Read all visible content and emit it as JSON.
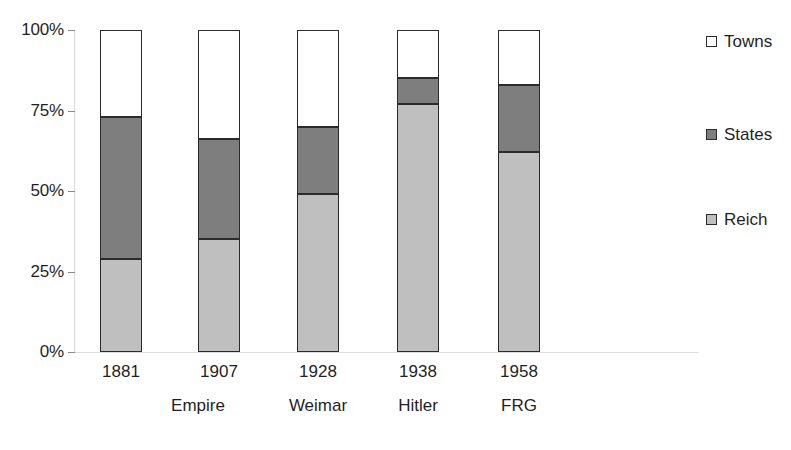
{
  "chart_data": {
    "type": "bar",
    "stacked": true,
    "stack_total": 100,
    "title": "",
    "subtitle": "",
    "xlabel": "",
    "ylabel": "",
    "ylim": [
      0,
      100
    ],
    "grid": false,
    "legend_position": "right",
    "categories": [
      "1881",
      "1907",
      "1928",
      "1938",
      "1958"
    ],
    "category_groups": [
      {
        "label": "Empire",
        "categories": [
          "1881",
          "1907"
        ]
      },
      {
        "label": "Weimar",
        "categories": [
          "1928"
        ]
      },
      {
        "label": "Hitler",
        "categories": [
          "1938"
        ]
      },
      {
        "label": "FRG",
        "categories": [
          "1958"
        ]
      }
    ],
    "series": [
      {
        "name": "Reich",
        "color": "#bfbfbf",
        "values": [
          29,
          35,
          49,
          77,
          62
        ]
      },
      {
        "name": "States",
        "color": "#7e7e7e",
        "values": [
          44,
          31,
          21,
          8,
          21
        ]
      },
      {
        "name": "Towns",
        "color": "#ffffff",
        "values": [
          27,
          34,
          30,
          15,
          17
        ]
      }
    ],
    "ytick_labels": [
      "100%",
      "75%",
      "50%",
      "25%",
      "0%"
    ],
    "ytick_values": [
      100,
      75,
      50,
      25,
      0
    ]
  },
  "axis": {
    "ticks": [
      {
        "label": "100%",
        "value": 100
      },
      {
        "label": "75%",
        "value": 75
      },
      {
        "label": "50%",
        "value": 50
      },
      {
        "label": "25%",
        "value": 25
      },
      {
        "label": "0%",
        "value": 0
      }
    ]
  },
  "bars": [
    {
      "year": "1881",
      "segments": [
        {
          "series": "Towns",
          "value": 27,
          "from": 73,
          "to": 100
        },
        {
          "series": "States",
          "value": 44,
          "from": 29,
          "to": 73
        },
        {
          "series": "Reich",
          "value": 29,
          "from": 0,
          "to": 29
        }
      ]
    },
    {
      "year": "1907",
      "segments": [
        {
          "series": "Towns",
          "value": 34,
          "from": 66,
          "to": 100
        },
        {
          "series": "States",
          "value": 31,
          "from": 35,
          "to": 66
        },
        {
          "series": "Reich",
          "value": 35,
          "from": 0,
          "to": 35
        }
      ]
    },
    {
      "year": "1928",
      "segments": [
        {
          "series": "Towns",
          "value": 30,
          "from": 70,
          "to": 100
        },
        {
          "series": "States",
          "value": 21,
          "from": 49,
          "to": 70
        },
        {
          "series": "Reich",
          "value": 49,
          "from": 0,
          "to": 49
        }
      ]
    },
    {
      "year": "1938",
      "segments": [
        {
          "series": "Towns",
          "value": 15,
          "from": 85,
          "to": 100
        },
        {
          "series": "States",
          "value": 8,
          "from": 77,
          "to": 85
        },
        {
          "series": "Reich",
          "value": 77,
          "from": 0,
          "to": 77
        }
      ]
    },
    {
      "year": "1958",
      "segments": [
        {
          "series": "Towns",
          "value": 17,
          "from": 83,
          "to": 100
        },
        {
          "series": "States",
          "value": 21,
          "from": 62,
          "to": 83
        },
        {
          "series": "Reich",
          "value": 62,
          "from": 0,
          "to": 62
        }
      ]
    }
  ],
  "eras": [
    {
      "label": "Empire"
    },
    {
      "label": "Weimar"
    },
    {
      "label": "Hitler"
    },
    {
      "label": "FRG"
    }
  ],
  "legend": {
    "items": [
      {
        "label": "Towns",
        "color": "#ffffff"
      },
      {
        "label": "States",
        "color": "#7e7e7e"
      },
      {
        "label": "Reich",
        "color": "#bfbfbf"
      }
    ]
  },
  "colors": {
    "towns": "#ffffff",
    "states": "#7e7e7e",
    "reich": "#bfbfbf",
    "outline": "#2b2b2b",
    "axis": "#d8d8d8",
    "text": "#1f1f1f"
  }
}
